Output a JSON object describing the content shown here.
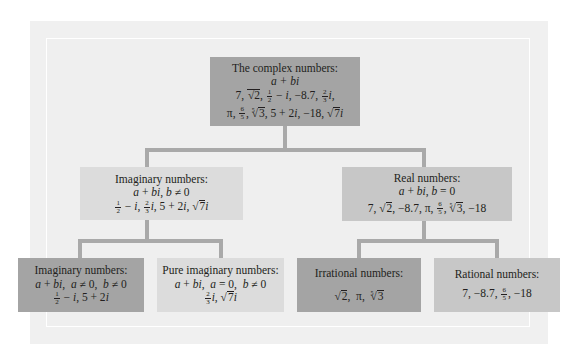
{
  "diagram": {
    "colors": {
      "outer_panel": "#f0f0f0",
      "inner_panel": "#efefef",
      "connector": "#a9a9a9",
      "box_dark": "#a4a4a4",
      "box_mid": "#c7c7c7",
      "box_light": "#dcdcdc"
    },
    "nodes": {
      "complex": {
        "title": "The complex numbers:",
        "form": "a + bi",
        "examples_line1": "7, √2, ½ − i, −8.7, ⅔i,",
        "examples_line2": "π, 6/5, ∛3 (5th root), 5 + 2i, −18, √7i"
      },
      "imaginary": {
        "title": "Imaginary numbers:",
        "condition": "a + bi, b ≠ 0",
        "examples": "½ − i, ⅔i, 5 + 2i, √7i"
      },
      "real": {
        "title": "Real numbers:",
        "condition": "a + bi, b = 0",
        "examples": "7, √2, −8.7, π, 6/5, ⁵√3, −18"
      },
      "imaginary_nonpure": {
        "title": "Imaginary numbers:",
        "condition": "a + bi,  a ≠ 0,  b ≠ 0",
        "examples": "½ − i, 5 + 2i"
      },
      "pure_imaginary": {
        "title": "Pure imaginary numbers:",
        "condition": "a + bi,  a = 0,  b ≠ 0",
        "examples": "⅔i, √7i"
      },
      "irrational": {
        "title": "Irrational numbers:",
        "examples": "√2,  π,  ⁵√3"
      },
      "rational": {
        "title": "Rational numbers:",
        "examples": "7, −8.7, 6/5, −18"
      }
    },
    "edges": [
      [
        "complex",
        "imaginary"
      ],
      [
        "complex",
        "real"
      ],
      [
        "imaginary",
        "imaginary_nonpure"
      ],
      [
        "imaginary",
        "pure_imaginary"
      ],
      [
        "real",
        "irrational"
      ],
      [
        "real",
        "rational"
      ]
    ]
  }
}
